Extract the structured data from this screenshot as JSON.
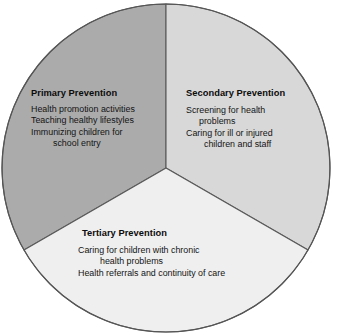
{
  "diagram": {
    "type": "pie-wedge-diagram",
    "shape": "circle",
    "segment_count": 3,
    "outline_color": "#555555",
    "background_color": "#ffffff",
    "segments": [
      {
        "id": "primary",
        "heading": "Primary Prevention",
        "fill_color": "#ABABAB",
        "position": "top-left",
        "lines": [
          "Health promotion activities",
          "Teaching healthy lifestyles",
          "Immunizing children for",
          "school entry"
        ]
      },
      {
        "id": "secondary",
        "heading": "Secondary Prevention",
        "fill_color": "#D8D8D8",
        "position": "top-right",
        "lines": [
          "Screening for health",
          "problems",
          "Caring for ill or injured",
          "children and staff"
        ]
      },
      {
        "id": "tertiary",
        "heading": "Tertiary Prevention",
        "fill_color": "#EFEFEF",
        "position": "bottom",
        "lines": [
          "Caring for children with chronic",
          "health problems",
          "Health referrals and continuity of care"
        ]
      }
    ]
  }
}
